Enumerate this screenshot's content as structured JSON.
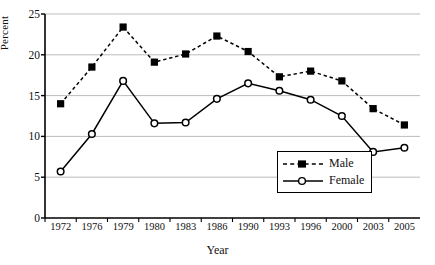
{
  "chart_data": {
    "type": "line",
    "title": "",
    "xlabel": "Year",
    "ylabel": "Percent",
    "categories": [
      "1972",
      "1976",
      "1979",
      "1980",
      "1983",
      "1986",
      "1990",
      "1993",
      "1996",
      "2000",
      "2003",
      "2005"
    ],
    "series": [
      {
        "name": "Male",
        "values": [
          14.0,
          18.5,
          23.4,
          19.1,
          20.1,
          22.3,
          20.4,
          17.3,
          18.0,
          16.8,
          13.4,
          11.4
        ],
        "marker": "filled-square",
        "line_style": "dashed",
        "color": "#000000"
      },
      {
        "name": "Female",
        "values": [
          5.7,
          10.3,
          16.8,
          11.6,
          11.7,
          14.6,
          16.5,
          15.6,
          14.5,
          12.5,
          8.1,
          8.6
        ],
        "marker": "open-circle",
        "line_style": "solid",
        "color": "#000000"
      }
    ],
    "ylim": [
      0,
      25
    ],
    "yticks": [
      0,
      5,
      10,
      15,
      20,
      25
    ],
    "grid": "horizontal",
    "legend_position": "bottom-right",
    "axis_color": "#000000",
    "grid_color": "#bcbcbc"
  },
  "legend": {
    "items": [
      {
        "label": "Male"
      },
      {
        "label": "Female"
      }
    ]
  }
}
